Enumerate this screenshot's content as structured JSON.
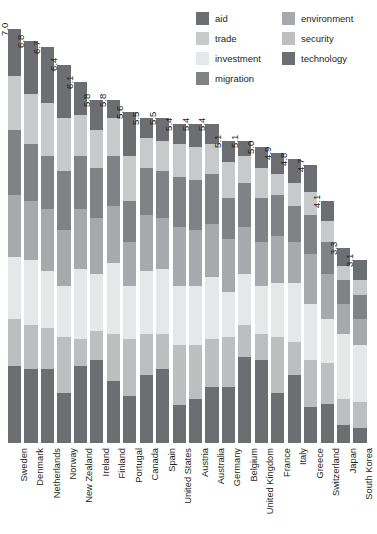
{
  "chart_data": {
    "type": "bar",
    "subtype": "stacked-bar",
    "title": "",
    "subtitle": "",
    "xlabel": "",
    "ylabel": "",
    "ylim": [
      0,
      7.0
    ],
    "grid": false,
    "legend_position": "top-right",
    "categories": [
      "Sweden",
      "Denmark",
      "Netherlands",
      "Norway",
      "New Zealand",
      "Ireland",
      "Finland",
      "Portugal",
      "Canada",
      "Spain",
      "United States",
      "Austria",
      "Australia",
      "Germany",
      "Belgium",
      "United Kingdom",
      "France",
      "Italy",
      "Greece",
      "Switzerland",
      "Japan",
      "South Korea"
    ],
    "totals": [
      "7.0",
      "6.8",
      "6.7",
      "6.4",
      "6.1",
      "5.8",
      "5.8",
      "5.6",
      "5.5",
      "5.5",
      "5.4",
      "5.4",
      "5.4",
      "5.1",
      "5.1",
      "5.0",
      "4.9",
      "4.8",
      "4.7",
      "4.1",
      "3.3",
      "3.1"
    ],
    "totals_numeric": [
      7.0,
      6.8,
      6.7,
      6.4,
      6.1,
      5.8,
      5.8,
      5.6,
      5.5,
      5.5,
      5.4,
      5.4,
      5.4,
      5.1,
      5.1,
      5.0,
      4.9,
      4.8,
      4.7,
      4.1,
      3.3,
      3.1
    ],
    "series": [
      {
        "name": "technology",
        "color": "#6d6e71",
        "values": [
          1.3,
          1.25,
          1.25,
          0.85,
          1.3,
          1.4,
          1.05,
          0.8,
          1.15,
          1.25,
          0.65,
          0.75,
          0.95,
          0.95,
          1.45,
          1.4,
          0.85,
          1.15,
          0.6,
          0.65,
          0.3,
          0.25
        ]
      },
      {
        "name": "security",
        "color": "#bcbec0",
        "values": [
          0.8,
          0.75,
          0.7,
          0.95,
          0.45,
          0.5,
          0.8,
          0.95,
          0.7,
          0.6,
          1.0,
          0.9,
          0.8,
          0.85,
          0.55,
          0.45,
          0.95,
          0.55,
          0.8,
          0.7,
          0.45,
          0.45
        ]
      },
      {
        "name": "investment",
        "color": "#e6e7e8",
        "values": [
          1.05,
          1.1,
          0.95,
          0.85,
          1.2,
          0.95,
          1.2,
          0.9,
          1.05,
          1.1,
          1.0,
          1.0,
          1.05,
          0.75,
          0.85,
          0.8,
          0.9,
          1.0,
          0.95,
          0.75,
          1.1,
          0.95
        ]
      },
      {
        "name": "environment",
        "color": "#a7a9ac",
        "values": [
          1.05,
          1.0,
          1.05,
          0.95,
          1.0,
          0.95,
          0.95,
          0.75,
          0.95,
          0.85,
          1.0,
          0.95,
          0.9,
          0.9,
          0.8,
          0.75,
          0.8,
          0.7,
          0.85,
          0.75,
          0.5,
          0.45
        ]
      },
      {
        "name": "migration",
        "color": "#808285",
        "values": [
          1.1,
          0.95,
          0.9,
          1.0,
          0.9,
          0.85,
          0.85,
          0.7,
          0.8,
          0.8,
          0.85,
          0.85,
          0.85,
          0.7,
          0.75,
          0.75,
          0.7,
          0.6,
          0.65,
          0.55,
          0.4,
          0.4
        ]
      },
      {
        "name": "trade",
        "color": "#c7c9cb",
        "values": [
          0.9,
          0.85,
          0.9,
          0.9,
          0.7,
          0.65,
          0.65,
          0.75,
          0.5,
          0.5,
          0.55,
          0.55,
          0.5,
          0.6,
          0.45,
          0.5,
          0.35,
          0.4,
          0.4,
          0.35,
          0.25,
          0.25
        ]
      },
      {
        "name": "aid",
        "color": "#6d6e71",
        "values": [
          0.8,
          0.9,
          0.95,
          0.9,
          0.55,
          0.5,
          0.3,
          0.75,
          0.35,
          0.4,
          0.35,
          0.4,
          0.35,
          0.35,
          0.25,
          0.35,
          0.35,
          0.4,
          0.45,
          0.35,
          0.3,
          0.35
        ]
      }
    ]
  },
  "legend": {
    "items": [
      {
        "label": "aid",
        "color": "#6d6e71"
      },
      {
        "label": "trade",
        "color": "#c7c9cb"
      },
      {
        "label": "investment",
        "color": "#e6e7e8"
      },
      {
        "label": "migration",
        "color": "#808285"
      },
      {
        "label": "environment",
        "color": "#a7a9ac"
      },
      {
        "label": "security",
        "color": "#bcbec0"
      },
      {
        "label": "technology",
        "color": "#6d6e71"
      }
    ]
  },
  "colors": {
    "background": "#ffffff",
    "text": "#231f20",
    "aid": "#6d6e71",
    "trade": "#c7c9cb",
    "investment": "#e6e7e8",
    "migration": "#808285",
    "environment": "#a7a9ac",
    "security": "#bcbec0",
    "technology": "#6d6e71"
  }
}
